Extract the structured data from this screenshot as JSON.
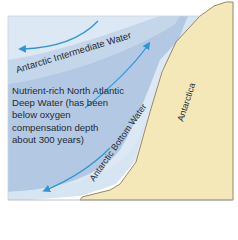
{
  "diagram": {
    "type": "ocean water masses cross-section",
    "colors": {
      "ocean_outer": "#dce8f3",
      "intermediate_band": "#c4d7ea",
      "deep_water": "#b3c9e3",
      "bottom_band": "#d6e5f2",
      "land": "#f5e8b8",
      "land_edge": "#8a7a5c",
      "arrow": "#2f96d6",
      "frame": "#a8b2bc"
    },
    "labels": {
      "intermediate": "Antarctic Intermediate Water",
      "bottom": "Antarctic Bottom Water",
      "land": "Antarctica",
      "deep_line1": "Nutrient-rich North Atlantic",
      "deep_line2": "Deep Water (has been",
      "deep_line3": "below oxygen",
      "deep_line4": "compensation depth",
      "deep_line5": "about 300 years)"
    },
    "arrows": [
      {
        "name": "intermediate-flow",
        "direction": "northward (left)"
      },
      {
        "name": "deep-upwelling",
        "direction": "up toward Antarctica"
      },
      {
        "name": "bottom-flow",
        "direction": "down-left along slope"
      }
    ]
  }
}
